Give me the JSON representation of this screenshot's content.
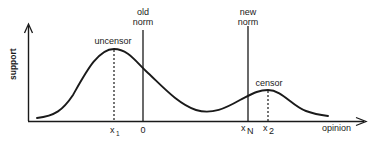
{
  "diagram": {
    "axes": {
      "y_label": "support",
      "x_label": "opinion"
    },
    "lines": {
      "old_norm": {
        "label_line1": "old",
        "label_line2": "norm"
      },
      "new_norm": {
        "label_line1": "new",
        "label_line2": "norm"
      }
    },
    "peaks": {
      "left": {
        "label": "uncensor"
      },
      "right": {
        "label": "censor"
      }
    },
    "ticks": {
      "x1": {
        "base": "x",
        "sub": "1"
      },
      "zero": {
        "label": "0"
      },
      "xN": {
        "base": "x",
        "sub": "N"
      },
      "x2": {
        "base": "x",
        "sub": "2"
      }
    },
    "colors": {
      "ink": "#1a1a1a",
      "background": "#ffffff"
    }
  }
}
